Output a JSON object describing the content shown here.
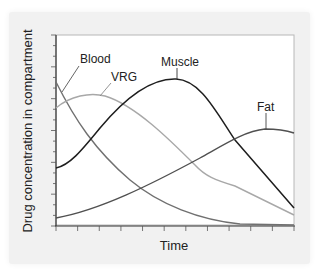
{
  "chart_data": {
    "type": "line",
    "title": "",
    "xlabel": "Time",
    "ylabel": "Drug concentration in compartment",
    "x_ticks": 11,
    "y_ticks": 18,
    "grid": false,
    "legend": "inline labels",
    "x": [
      0,
      1,
      2,
      3,
      4,
      5,
      6,
      7,
      8,
      9,
      10
    ],
    "xlim": [
      0,
      10
    ],
    "ylim": [
      0,
      100
    ],
    "series": [
      {
        "name": "Blood",
        "color": "#707070",
        "values": [
          75,
          55,
          36,
          22,
          13,
          8,
          5,
          3,
          2,
          1,
          1
        ]
      },
      {
        "name": "VRG",
        "color": "#a8a8a8",
        "values": [
          62,
          68,
          67,
          58,
          40,
          22,
          15,
          12,
          9,
          7,
          5
        ]
      },
      {
        "name": "Muscle",
        "color": "#1e1e1e",
        "values": [
          30,
          42,
          58,
          72,
          80,
          76,
          62,
          44,
          28,
          16,
          9
        ]
      },
      {
        "name": "Fat",
        "color": "#505050",
        "values": [
          4,
          9,
          15,
          22,
          29,
          36,
          42,
          47,
          50,
          50,
          48
        ]
      }
    ],
    "annotations": [
      "Blood",
      "VRG",
      "Muscle",
      "Fat"
    ]
  },
  "labels": {
    "blood": "Blood",
    "vrg": "VRG",
    "muscle": "Muscle",
    "fat": "Fat",
    "x_axis": "Time",
    "y_axis": "Drug concentration in compartment"
  }
}
